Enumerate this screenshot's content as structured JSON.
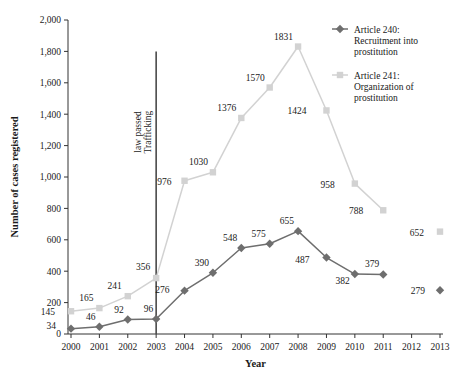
{
  "chart_data": {
    "type": "line",
    "title": "",
    "xlabel": "Year",
    "ylabel": "Number of cases registered",
    "xlim": [
      2000,
      2013
    ],
    "ylim": [
      0,
      2000
    ],
    "grid": false,
    "legend_position": "top-right",
    "x": [
      2000,
      2001,
      2002,
      2003,
      2004,
      2005,
      2006,
      2007,
      2008,
      2009,
      2010,
      2011,
      2012,
      2013
    ],
    "xtick_labels": [
      "2000",
      "2001",
      "2002",
      "2003",
      "2004",
      "2005",
      "2006",
      "2007",
      "2008",
      "2009",
      "2010",
      "2011",
      "2012",
      "2013"
    ],
    "ytick_values": [
      0,
      200,
      400,
      600,
      800,
      1000,
      1200,
      1400,
      1600,
      1800,
      2000
    ],
    "ytick_labels": [
      "0",
      "200",
      "400",
      "600",
      "800",
      "1,000",
      "1,200",
      "1,400",
      "1,600",
      "1,800",
      "2,000"
    ],
    "series": [
      {
        "name": "Article 240: Recruitment into prostitution",
        "color": "#6e6e6e",
        "marker": "diamond",
        "x": [
          2000,
          2001,
          2002,
          2003,
          2004,
          2005,
          2006,
          2007,
          2008,
          2009,
          2010,
          2011
        ],
        "values": [
          34,
          46,
          92,
          96,
          276,
          390,
          548,
          575,
          655,
          487,
          382,
          379
        ],
        "labels": [
          "34",
          "46",
          "92",
          "96",
          "276",
          "390",
          "548",
          "575",
          "655",
          "487",
          "382",
          "379"
        ],
        "detached_points": [
          {
            "x": 2013,
            "value": 279,
            "label": "279"
          }
        ]
      },
      {
        "name": "Article 241: Organization of prostitution",
        "color": "#d2d2d2",
        "marker": "square",
        "x": [
          2000,
          2001,
          2002,
          2003,
          2004,
          2005,
          2006,
          2007,
          2008,
          2009,
          2010,
          2011
        ],
        "values": [
          145,
          165,
          241,
          356,
          976,
          1030,
          1376,
          1570,
          1831,
          1424,
          958,
          788
        ],
        "labels": [
          "145",
          "165",
          "241",
          "356",
          "976",
          "1030",
          "1376",
          "1570",
          "1831",
          "1424",
          "958",
          "788"
        ],
        "detached_points": [
          {
            "x": 2013,
            "value": 652,
            "label": "652"
          }
        ]
      }
    ],
    "annotations": [
      {
        "name": "trafficking-law-line",
        "text": "Trafficking\nlaw passed",
        "line1": "Trafficking",
        "line2": "law passed",
        "x": 2003,
        "y_from": 0,
        "y_to": 1800,
        "color": "#4a4a4a"
      }
    ]
  },
  "legend": {
    "items": [
      {
        "label_line1": "Article 240:",
        "label_line2": "Recruitment into",
        "label_line3": "prostitution"
      },
      {
        "label_line1": "Article 241:",
        "label_line2": "Organization of",
        "label_line3": "prostitution"
      }
    ]
  }
}
